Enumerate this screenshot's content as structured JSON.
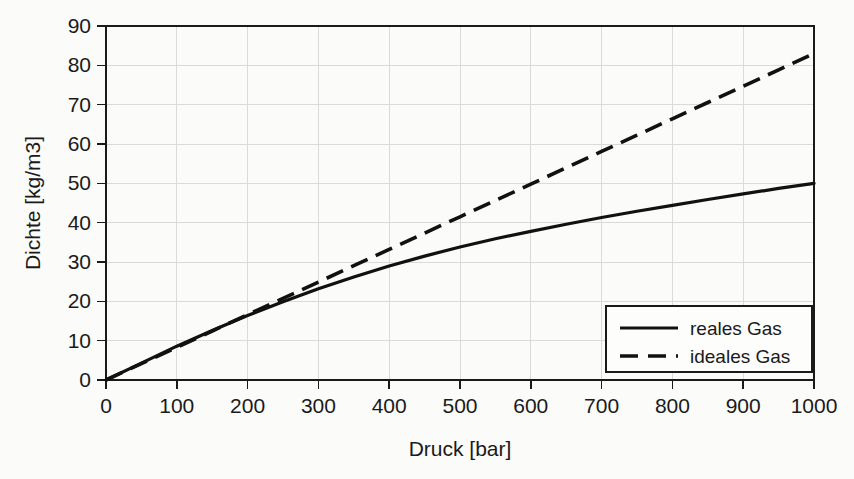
{
  "chart_data": {
    "type": "line",
    "title": "",
    "xlabel": "Druck [bar]",
    "ylabel": "Dichte [kg/m3]",
    "xlim": [
      0,
      1000
    ],
    "ylim": [
      0,
      90
    ],
    "xticks": [
      "0",
      "100",
      "200",
      "300",
      "400",
      "500",
      "600",
      "700",
      "800",
      "900",
      "1000"
    ],
    "yticks": [
      "0",
      "10",
      "20",
      "30",
      "40",
      "50",
      "60",
      "70",
      "80",
      "90"
    ],
    "grid": "both",
    "legend_position": "bottom-right",
    "x": [
      0,
      50,
      100,
      150,
      200,
      250,
      300,
      350,
      400,
      450,
      500,
      550,
      600,
      650,
      700,
      750,
      800,
      850,
      900,
      950,
      1000
    ],
    "series": [
      {
        "name": "reales Gas",
        "style": "solid",
        "color": "#111111",
        "values": [
          0,
          4.3,
          8.6,
          12.6,
          16.4,
          19.9,
          23.2,
          26.2,
          29.0,
          31.5,
          33.8,
          35.9,
          37.8,
          39.6,
          41.3,
          42.9,
          44.4,
          45.9,
          47.3,
          48.7,
          50.0
        ]
      },
      {
        "name": "ideales Gas",
        "style": "dashed",
        "color": "#111111",
        "values": [
          0,
          4.15,
          8.3,
          12.45,
          16.6,
          20.75,
          24.9,
          29.05,
          33.2,
          37.35,
          41.5,
          45.65,
          49.8,
          53.95,
          58.1,
          62.25,
          66.4,
          70.55,
          74.7,
          78.85,
          83.0
        ]
      }
    ]
  },
  "legend": {
    "items": [
      {
        "label": "reales Gas",
        "style": "solid"
      },
      {
        "label": "ideales Gas",
        "style": "dashed"
      }
    ]
  }
}
